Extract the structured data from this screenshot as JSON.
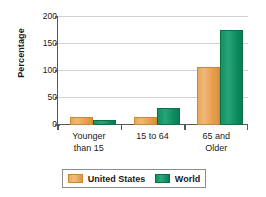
{
  "chart_data": {
    "type": "bar",
    "title": "",
    "xlabel": "",
    "ylabel": "Percentage",
    "ylim": [
      0,
      200
    ],
    "yticks": [
      0,
      50,
      100,
      150,
      200
    ],
    "ytick_labels": [
      "0",
      "50",
      "100",
      "150",
      "200"
    ],
    "grid": true,
    "legend_position": "bottom",
    "categories": [
      "Younger than 15",
      "15 to 64",
      "65 and Older"
    ],
    "category_lines": [
      [
        "Younger",
        "than 15"
      ],
      [
        "15 to 64",
        ""
      ],
      [
        "65 and",
        "Older"
      ]
    ],
    "series": [
      {
        "name": "United States",
        "color": "#e8a455",
        "values": [
          15,
          15,
          108
        ]
      },
      {
        "name": "World",
        "color": "#128f62",
        "values": [
          9,
          31,
          176
        ]
      }
    ]
  },
  "legend": {
    "items": [
      {
        "label": "United States",
        "swatch": "us-swatch"
      },
      {
        "label": "World",
        "swatch": "world-swatch"
      }
    ]
  },
  "axis": {
    "y_title": "Percentage"
  }
}
